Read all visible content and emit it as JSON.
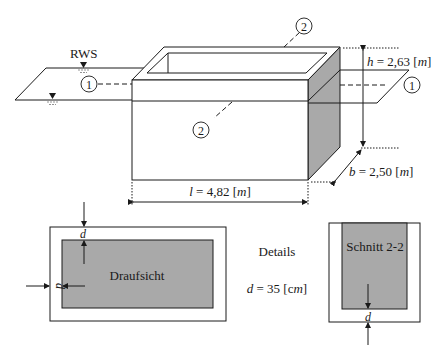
{
  "figure": {
    "water_level_label": "RWS",
    "section_marks": [
      "1",
      "2"
    ],
    "dimensions": {
      "height": {
        "symbol": "h",
        "value": "2,63",
        "unit": "m"
      },
      "width": {
        "symbol": "b",
        "value": "2,50",
        "unit": "m"
      },
      "length": {
        "symbol": "l",
        "value": "4,82",
        "unit": "m"
      }
    },
    "details": {
      "heading": "Details",
      "thickness": {
        "symbol": "d",
        "value": "35",
        "unit": "cm"
      },
      "plan_view_label": "Draufsicht",
      "section_label": "Schnitt 2-2",
      "thickness_symbol": "d"
    }
  },
  "text": {
    "h_eq": " = 2,63 [",
    "b_eq": " = 2,50 [",
    "l_eq": " = 4,82 [",
    "d_eq": " = 35 [c",
    "close": "]",
    "m": "m",
    "h": "h",
    "b": "b",
    "l": "l",
    "d": "d",
    "one": "1",
    "two": "2",
    "rws": "RWS",
    "details": "Details",
    "draufsicht": "Draufsicht",
    "schnitt": "Schnitt 2-2"
  },
  "colors": {
    "line": "#1a1a1a",
    "concrete_shade": "#a9a9a9",
    "background": "#ffffff"
  }
}
